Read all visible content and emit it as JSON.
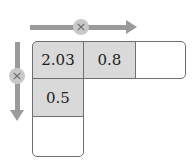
{
  "operations": {
    "horizontal": {
      "symbol": "×",
      "direction": "right"
    },
    "vertical": {
      "symbol": "×",
      "direction": "down"
    }
  },
  "grid": {
    "top_row": [
      "2.03",
      "0.8",
      ""
    ],
    "left_column": [
      "2.03",
      "0.5",
      ""
    ]
  },
  "colors": {
    "shaded_cell": "#d9d9d9",
    "arrow": "#9a9a9a",
    "border": "#6e6e6e"
  }
}
